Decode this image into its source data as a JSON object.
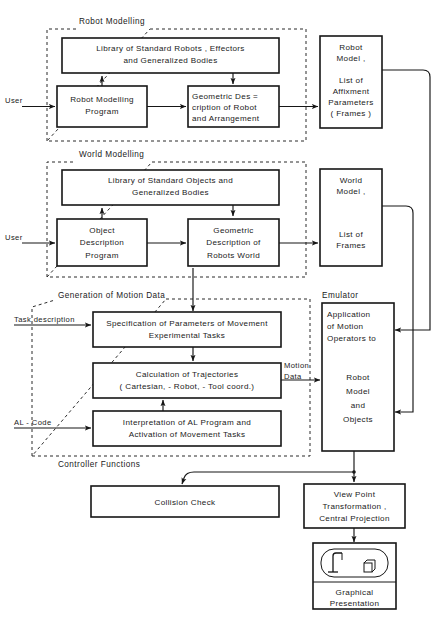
{
  "diagram": {
    "groups": [
      {
        "id": "robot-modelling",
        "label": "Robot Modelling"
      },
      {
        "id": "world-modelling",
        "label": "World Modelling"
      },
      {
        "id": "generation-of-motion-data",
        "label": "Generation of Motion Data"
      },
      {
        "id": "emulator",
        "label": "Emulator"
      },
      {
        "id": "controller-functions",
        "label": "Controller Functions"
      }
    ],
    "boxes": {
      "library_standard_robots": {
        "lines": [
          "Library of Standard Robots ,  Effectors",
          "and Generalized Bodies"
        ]
      },
      "robot_modelling_program": {
        "lines": [
          "Robot Modelling",
          "Program"
        ]
      },
      "geometric_description_robot": {
        "lines": [
          "Geometric   Des =",
          "cription of Robot",
          "and Arrangement"
        ]
      },
      "robot_model": {
        "lines": [
          "Robot",
          "Model ,",
          "",
          "List of",
          "Affixment",
          "Parameters",
          "( Frames )"
        ]
      },
      "library_standard_objects": {
        "lines": [
          "Library of Standard Objects and",
          "Generalized  Bodies"
        ]
      },
      "object_description_program": {
        "lines": [
          "Object",
          "Description",
          "Program"
        ]
      },
      "geometric_description_world": {
        "lines": [
          "Geometric",
          "Description of",
          "Robots World"
        ]
      },
      "world_model": {
        "lines": [
          "World",
          "Model ,",
          "",
          "List of",
          "Frames"
        ]
      },
      "specification_parameters": {
        "lines": [
          "Specification  of  Parameters  of  Movement",
          "Experimental  Tasks"
        ]
      },
      "calculation_trajectories": {
        "lines": [
          "Calculation   of   Trajectories",
          "( Cartesian, -  Robot, -  Tool coord.)"
        ]
      },
      "interpretation_al_program": {
        "lines": [
          "Interpretation of AL Program and",
          "Activation of Movement Tasks"
        ]
      },
      "emulator_body": {
        "lines": [
          "Application",
          "of  Motion",
          "Operators to",
          "",
          "",
          "Robot",
          "Model",
          "and",
          "Objects"
        ]
      },
      "collision_check": {
        "lines": [
          "Collision   Check"
        ]
      },
      "view_point_transformation": {
        "lines": [
          "View  Point",
          "Transformation ,",
          "Central  Projection"
        ]
      },
      "graphical_presentation": {
        "lines": [
          "Graphical",
          "Presentation"
        ]
      }
    },
    "edge_labels": [
      {
        "id": "user-robot",
        "text": "User"
      },
      {
        "id": "user-world",
        "text": "User"
      },
      {
        "id": "task-description",
        "text": "Task description"
      },
      {
        "id": "al-code",
        "text": "AL - Code"
      },
      {
        "id": "motion-data",
        "text": "Motion",
        "text2": "Data"
      }
    ],
    "icons": {
      "robot_scene": "robot-arm-and-cube-icon"
    },
    "colors": {
      "background": "#ffffff",
      "ink": "#161616",
      "dashed": "#2b2b2b"
    }
  }
}
